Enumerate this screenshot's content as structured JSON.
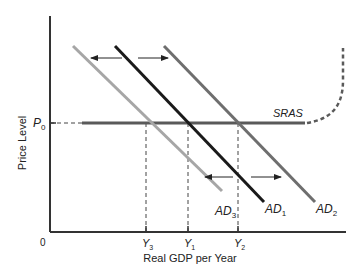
{
  "diagram": {
    "y_axis_label": "Price Level",
    "x_axis_label": "Real GDP per Year",
    "origin_label": "0",
    "price_label": {
      "main": "P",
      "sub": "0"
    },
    "sras_label": "SRAS",
    "curves": [
      {
        "name": "AD3",
        "main": "AD",
        "sub": "3",
        "color": "#a6a6a6"
      },
      {
        "name": "AD1",
        "main": "AD",
        "sub": "1",
        "color": "#1a1a1a"
      },
      {
        "name": "AD2",
        "main": "AD",
        "sub": "2",
        "color": "#6e6e6e"
      }
    ],
    "x_ticks": [
      {
        "main": "Y",
        "sub": "3"
      },
      {
        "main": "Y",
        "sub": "1"
      },
      {
        "main": "Y",
        "sub": "2"
      }
    ],
    "colors": {
      "axis": "#333333",
      "sras": "#5a5a5a",
      "dashed_guides": "#444444",
      "arrows": "#222222"
    }
  }
}
